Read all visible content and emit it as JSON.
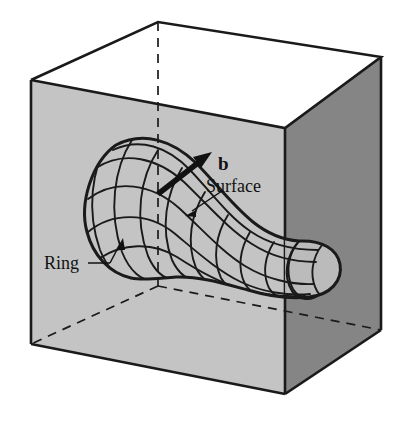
{
  "figure": {
    "type": "3d-line-diagram",
    "background_color": "#ffffff",
    "labels": {
      "burgers_vector": "b",
      "surface": "Surface",
      "ring": "Ring"
    },
    "colors": {
      "outline": "#1a1a1a",
      "cube_top_face": "#ffffff",
      "cube_front_face": "#c4c4c4",
      "cube_right_face": "#858585",
      "mesh_line": "#1a1a1a",
      "arrow": "#111111",
      "label_text": "#111111"
    },
    "cube": {
      "front_top_left": [
        31,
        80
      ],
      "front_top_right": [
        285,
        128
      ],
      "front_bottom_left": [
        31,
        344
      ],
      "front_bottom_right": [
        285,
        394
      ],
      "back_top": [
        158,
        22
      ],
      "right_top": [
        381,
        57
      ],
      "right_bottom": [
        381,
        330
      ],
      "hidden_edges": "dashed",
      "hidden_back_vertical_from": [
        158,
        22
      ],
      "hidden_back_vertical_to": [
        158,
        286
      ],
      "hidden_back_bottom_left_to": [
        31,
        344
      ],
      "hidden_back_bottom_right_to": [
        381,
        330
      ]
    },
    "surface": {
      "description": "curved tube-like slipped surface with quadrilateral mesh",
      "mesh_rows": 5,
      "mesh_cols": 9,
      "left_end": "rounded lobe near front-left of cube",
      "right_end": "rounded cap crossing the front-right cube edge"
    },
    "annotations": [
      {
        "name": "burgers-vector-arrow",
        "label": "b",
        "style": "thick solid arrow",
        "tail": [
          160,
          192
        ],
        "head": [
          208,
          155
        ],
        "label_pos": [
          219,
          168
        ]
      },
      {
        "name": "surface-leader",
        "label": "Surface",
        "style": "thin leader line with small arrowhead",
        "tail": [
          222,
          192
        ],
        "head": [
          186,
          215
        ],
        "label_pos": [
          219,
          192
        ]
      },
      {
        "name": "ring-leader",
        "label": "Ring",
        "style": "thin leader line with arrowhead",
        "tail": [
          93,
          263
        ],
        "head": [
          119,
          242
        ],
        "label_pos": [
          46,
          263
        ]
      }
    ]
  }
}
